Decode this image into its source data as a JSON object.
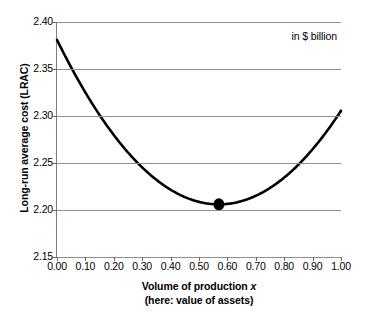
{
  "chart_data": {
    "type": "line",
    "title": "",
    "annotation": "in $ billion",
    "xlabel": "Volume of production x",
    "xlabel_sub": "(here: value of assets)",
    "xlabel_text": "Volume of production ",
    "xlabel_italic": "x",
    "ylabel": "Long-run average cost (LRAC)",
    "xlim": [
      0.0,
      1.0
    ],
    "ylim": [
      2.15,
      2.4
    ],
    "grid": "horizontal",
    "legend": "none",
    "xticks": [
      "0.00",
      "0.10",
      "0.20",
      "0.30",
      "0.40",
      "0.50",
      "0.60",
      "0.70",
      "0.80",
      "0.90",
      "1.00"
    ],
    "xtick_values": [
      0.0,
      0.1,
      0.2,
      0.3,
      0.4,
      0.5,
      0.6,
      0.7,
      0.8,
      0.9,
      1.0
    ],
    "yticks": [
      "2.15",
      "2.20",
      "2.25",
      "2.30",
      "2.35",
      "2.40"
    ],
    "ytick_values": [
      2.15,
      2.2,
      2.25,
      2.3,
      2.35,
      2.4
    ],
    "series": [
      {
        "name": "LRAC",
        "color": "#000000",
        "x": [
          0.0,
          0.05,
          0.1,
          0.15,
          0.2,
          0.25,
          0.3,
          0.35,
          0.4,
          0.45,
          0.5,
          0.55,
          0.57,
          0.6,
          0.65,
          0.7,
          0.75,
          0.8,
          0.85,
          0.9,
          0.95,
          1.0
        ],
        "y": [
          2.381,
          2.37,
          2.36,
          2.35,
          2.341,
          2.332,
          2.324,
          2.317,
          2.311,
          2.305,
          2.301,
          2.2057,
          2.2055,
          2.206,
          2.2098,
          2.2147,
          2.2226,
          2.2332,
          2.2465,
          2.2626,
          2.2813,
          2.305
        ],
        "equation": "y = 0.540 * (x - 0.57)^2 + 2.2055"
      }
    ],
    "markers": [
      {
        "name": "minimum-point",
        "x": 0.57,
        "y": 2.206,
        "color": "#000000",
        "shape": "circle"
      }
    ]
  }
}
